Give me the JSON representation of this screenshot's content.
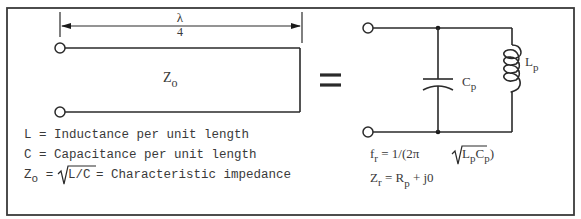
{
  "figure": {
    "type": "quarter-wave transmission line equivalent circuit",
    "left": {
      "dimension_label": {
        "numerator": "λ",
        "denominator": "4"
      },
      "line_impedance": {
        "main": "Z",
        "sub": "o"
      },
      "definitions": [
        {
          "symbol": "L",
          "text": " = Inductance per unit length"
        },
        {
          "symbol": "C",
          "text": " = Capacitance per unit length"
        }
      ],
      "zo_definition": {
        "symbol": "Z",
        "sub": "o",
        "equals": " = ",
        "radicand": "L/C",
        "text": " = Characteristic impedance"
      }
    },
    "equals_sign": "=",
    "right": {
      "capacitor_label": {
        "main": "C",
        "sub": "p"
      },
      "inductor_label": {
        "main": "L",
        "sub": "p"
      },
      "fr_equation": {
        "lhs": "f",
        "lhs_sub": "r",
        "mid": " = 1/(2π ",
        "rad_L": "L",
        "rad_L_sub": "p",
        "rad_C": "C",
        "rad_C_sub": "p",
        "close": ")"
      },
      "zr_equation": {
        "lhs": "Z",
        "lhs_sub": "r",
        "mid": " = R",
        "r_sub": "p",
        "tail": " + j0"
      }
    }
  }
}
